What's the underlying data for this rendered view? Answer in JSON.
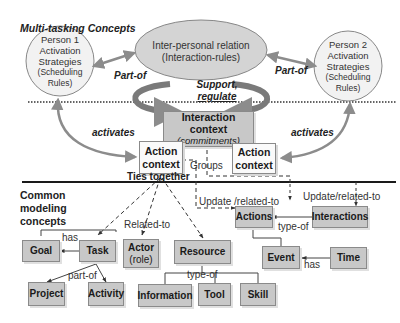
{
  "title": "Multi-tasking Concepts",
  "upper": {
    "person1": {
      "line1": "Person 1",
      "line2": "Activation",
      "line3": "Strategies",
      "line4": "(Scheduling",
      "line5": "Rules)"
    },
    "person2": {
      "line1": "Person 2",
      "line2": "Activation",
      "line3": "Strategies",
      "line4": "(Scheduling",
      "line5": "Rules)"
    },
    "relation": {
      "line1": "Inter-personal relation",
      "line2": "(Interaction-rules)"
    },
    "part_of_left": "Part-of",
    "part_of_right": "Part-of",
    "support": {
      "line1": "Support,",
      "line2": "regulate"
    },
    "interaction_context": {
      "line1": "Interaction context",
      "line2": "(commitments)"
    },
    "activates_left": "activates",
    "activates_right": "activates",
    "action_context_left": {
      "line1": "Action",
      "line2": "context"
    },
    "action_context_right": {
      "line1": "Action",
      "line2": "context"
    },
    "groups": "Groups",
    "ties_together": "Ties together"
  },
  "lower": {
    "heading": {
      "line1": "Common",
      "line2": "modeling",
      "line3": "concepts"
    },
    "related_to": "Related-to",
    "update_related_left": "Update /related-to",
    "update_related_right": "Update/related-to",
    "has_goal": "has",
    "part_of": "part-of",
    "type_of_resource": "type-of",
    "type_of_actions": "type-of",
    "has_time": "has",
    "boxes": {
      "goal": "Goal",
      "task": "Task",
      "actor": {
        "line1": "Actor",
        "line2": "(role)"
      },
      "resource": "Resource",
      "actions": "Actions",
      "interactions": "Interactions",
      "event": "Event",
      "time": "Time",
      "project": "Project",
      "activity": "Activity",
      "information": "Information",
      "tool": "Tool",
      "skill": "Skill"
    }
  },
  "colors": {
    "box_fill": "#c8c8c8",
    "ellipse_fill": "#d4d4d4",
    "arrow_gray": "#8c8c8c",
    "line_dark": "#1a1a1a"
  }
}
